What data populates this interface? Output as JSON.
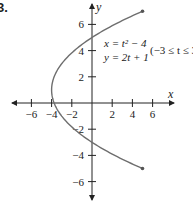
{
  "problem_number": "3.",
  "chart_data": {
    "type": "line",
    "title": "",
    "xlabel": "x",
    "ylabel": "y",
    "xlim": [
      -7.5,
      8
    ],
    "ylim": [
      -7.3,
      7.5
    ],
    "x_ticks": [
      -6,
      -4,
      -2,
      2,
      4,
      6
    ],
    "y_ticks": [
      -6,
      -4,
      -2,
      2,
      4,
      6
    ],
    "grid": false,
    "legend": null,
    "annotation": {
      "eq1": "x = t² − 4",
      "eq2": "y = 2t + 1",
      "range": "(−3 ≤ t ≤ 3)"
    },
    "series": [
      {
        "name": "parametric curve x = t^2 - 4, y = 2t + 1",
        "t_range": [
          -3,
          3
        ],
        "points": [
          {
            "t": -3,
            "x": 5,
            "y": -5
          },
          {
            "t": -2,
            "x": 0,
            "y": -3
          },
          {
            "t": -1,
            "x": -3,
            "y": -1
          },
          {
            "t": 0,
            "x": -4,
            "y": 1
          },
          {
            "t": 1,
            "x": -3,
            "y": 3
          },
          {
            "t": 2,
            "x": 0,
            "y": 5
          },
          {
            "t": 3,
            "x": 5,
            "y": 7
          }
        ],
        "endpoints": [
          [
            5,
            -5
          ],
          [
            5,
            7
          ]
        ],
        "color": "#6e6e6e"
      }
    ]
  }
}
